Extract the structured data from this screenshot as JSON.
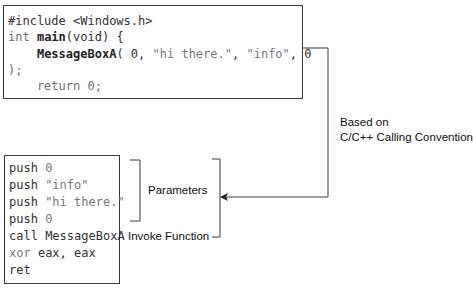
{
  "c_code": {
    "lines": [
      {
        "parts": [
          "#include <Windows.h>"
        ]
      },
      {
        "parts": [
          "int ",
          "main",
          "(void) {"
        ]
      },
      {
        "parts": [
          "    ",
          "MessageBoxA",
          "( 0, ",
          "\"hi there.\"",
          ", ",
          "\"info\"",
          ", 0"
        ]
      },
      {
        "parts": [
          ");"
        ]
      },
      {
        "parts": [
          "    return 0;"
        ]
      }
    ]
  },
  "asm_code": {
    "lines": [
      {
        "op": "push",
        "arg": "0"
      },
      {
        "op": "push",
        "arg": "\"info\""
      },
      {
        "op": "push",
        "arg": "\"hi there.\""
      },
      {
        "op": "push",
        "arg": "0"
      },
      {
        "op": "call",
        "arg": "MessageBoxA"
      },
      {
        "op": "xor",
        "arg": "eax, eax"
      },
      {
        "op": "ret",
        "arg": ""
      }
    ]
  },
  "labels": {
    "parameters": "Parameters",
    "invoke_function": "Invoke Function",
    "convention_line1": "Based on",
    "convention_line2": "C/C++ Calling Convention"
  },
  "colors": {
    "border": "#3a3a3a",
    "text": "#333333",
    "keyword_gray": "#7a7a7a"
  }
}
